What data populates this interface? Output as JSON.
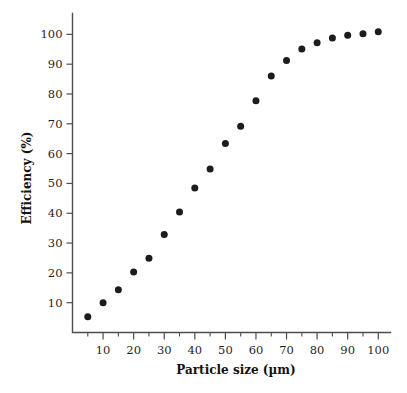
{
  "chart_data": {
    "type": "scatter",
    "title": "",
    "xlabel": "Particle size (µm)",
    "ylabel": "Efficiency (%)",
    "xlim": [
      0,
      104
    ],
    "ylim": [
      0,
      107
    ],
    "grid": false,
    "legend": null,
    "marker": {
      "shape": "circle",
      "color": "#1c1c1c",
      "size_px": 7
    },
    "x_ticks_major": [
      10,
      20,
      30,
      40,
      50,
      60,
      70,
      80,
      90,
      100
    ],
    "x_tick_labels": [
      "10",
      "20",
      "30",
      "40",
      "50",
      "60",
      "70",
      "80",
      "90",
      "100"
    ],
    "x_ticks_minor": [
      5,
      15,
      25,
      35,
      45,
      55,
      65,
      75,
      85,
      95
    ],
    "y_ticks_major": [
      10,
      20,
      30,
      40,
      50,
      60,
      70,
      80,
      90,
      100
    ],
    "y_tick_labels": [
      "10",
      "20",
      "30",
      "40",
      "50",
      "60",
      "70",
      "80",
      "90",
      "100"
    ],
    "x": [
      5,
      10,
      15,
      20,
      25,
      30,
      35,
      40,
      45,
      50,
      55,
      60,
      65,
      70,
      75,
      80,
      85,
      90,
      95,
      100
    ],
    "values": [
      5.3,
      10.0,
      14.3,
      20.3,
      24.9,
      32.9,
      40.4,
      48.5,
      54.8,
      63.4,
      69.2,
      77.7,
      86.0,
      91.2,
      95.1,
      97.2,
      98.8,
      99.7,
      100.2,
      100.9
    ],
    "series": [
      {
        "name": "Efficiency",
        "x": [
          5,
          10,
          15,
          20,
          25,
          30,
          35,
          40,
          45,
          50,
          55,
          60,
          65,
          70,
          75,
          80,
          85,
          90,
          95,
          100
        ],
        "values": [
          5.3,
          10.0,
          14.3,
          20.3,
          24.9,
          32.9,
          40.4,
          48.5,
          54.8,
          63.4,
          69.2,
          77.7,
          86.0,
          91.2,
          95.1,
          97.2,
          98.8,
          99.7,
          100.2,
          100.9
        ]
      }
    ]
  },
  "colors": {
    "background": "#ffffff",
    "axis": "#4d4d4d",
    "marker": "#1c1c1c",
    "text": "#1f1f1f"
  }
}
